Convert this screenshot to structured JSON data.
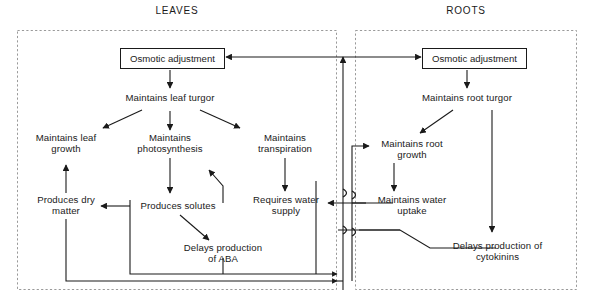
{
  "diagram": {
    "title_leaves": "LEAVES",
    "title_roots": "ROOTS",
    "stroke_color": "#1a1a1a",
    "dashed_border_color": "#9a9a9a",
    "background": "#ffffff"
  },
  "nodes": {
    "leaves_osmotic": "Osmotic adjustment",
    "leaf_turgor": "Maintains leaf turgor",
    "leaf_growth": "Maintains leaf\ngrowth",
    "photosynthesis": "Maintains\nphotosynthesis",
    "transpiration": "Maintains\ntranspiration",
    "dry_matter": "Produces dry\nmatter",
    "solutes": "Produces solutes",
    "water_supply": "Requires water\nsupply",
    "aba": "Delays production\nof ABA",
    "roots_osmotic": "Osmotic adjustment",
    "root_turgor": "Maintains root turgor",
    "root_growth": "Maintains root\ngrowth",
    "water_uptake": "Maintains water\nuptake",
    "cytokinins": "Delays production of\ncytokinins"
  }
}
